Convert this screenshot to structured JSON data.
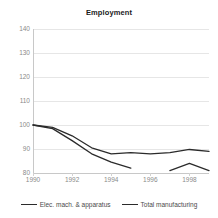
{
  "chart_data": {
    "type": "line",
    "title": "Employment",
    "xlabel": "",
    "ylabel": "",
    "xlim": [
      1990,
      1999
    ],
    "ylim": [
      80,
      140
    ],
    "grid": true,
    "legend_position": "bottom",
    "x_tick_labels": [
      "1990",
      "1992",
      "1994",
      "1996",
      "1998"
    ],
    "x_ticks": [
      1990,
      1992,
      1994,
      1996,
      1998
    ],
    "y_tick_labels": [
      "140",
      "130",
      "120",
      "110",
      "100",
      "90",
      "80"
    ],
    "y_ticks": [
      140,
      130,
      120,
      110,
      100,
      90,
      80
    ],
    "series": [
      {
        "name": "Elec. mach. & apparatus",
        "color": "#2b2b2b",
        "x": [
          1990,
          1991,
          1992,
          1993,
          1994,
          1995,
          1997,
          1998,
          1999
        ],
        "values": [
          100,
          98.5,
          93.5,
          88,
          84.5,
          82,
          81,
          84,
          81
        ],
        "gaps": [
          [
            1995,
            1997
          ]
        ]
      },
      {
        "name": "Total manufacturing",
        "color": "#2b2b2b",
        "x": [
          1990,
          1991,
          1992,
          1993,
          1994,
          1995,
          1996,
          1997,
          1998,
          1999
        ],
        "values": [
          100,
          99,
          95.5,
          90.5,
          88,
          88.5,
          88,
          88.5,
          89.8,
          89
        ]
      }
    ]
  },
  "legend": {
    "entries": [
      {
        "label": "Elec. mach. & apparatus"
      },
      {
        "label": "Total manufacturing"
      }
    ]
  },
  "colors": {
    "series_line": "#2b2b2b",
    "gridline": "#e6e6e6",
    "axis": "#c8c8c8",
    "tick_text": "#8a8a8a",
    "title_text": "#1a1a1a",
    "background": "#ffffff"
  }
}
